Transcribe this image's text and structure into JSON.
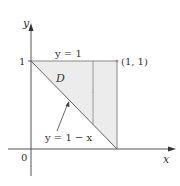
{
  "diagram": {
    "axis_labels": {
      "x": "x",
      "y": "y"
    },
    "origin_label": "0",
    "tick_label_y": "1",
    "region_label": "D",
    "top_boundary_label": "y = 1",
    "diagonal_boundary_label": "y = 1 − x",
    "corner_point_label": "(1, 1)",
    "colors": {
      "region_fill": "#ececec",
      "lines": "#777777",
      "text": "#333333"
    }
  }
}
